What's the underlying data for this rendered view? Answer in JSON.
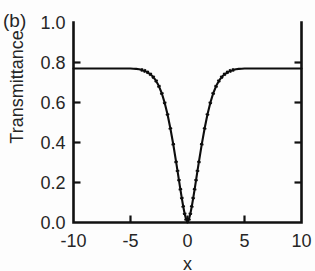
{
  "figure": {
    "panel_label": "(b)",
    "background_color": "#fdfdfd",
    "line_color": "#0d0d0d",
    "axis_color": "#111111"
  },
  "chart_data": {
    "type": "line",
    "title": "",
    "panel": "(b)",
    "xlabel": "x",
    "ylabel": "Transmittance",
    "xlim": [
      -10,
      10
    ],
    "ylim": [
      0.0,
      1.0
    ],
    "xticks": [
      -10,
      -5,
      0,
      5,
      10
    ],
    "xtick_labels": [
      "-10",
      "-5",
      "0",
      "5",
      "10"
    ],
    "yticks": [
      0.0,
      0.2,
      0.4,
      0.6,
      0.8,
      1.0
    ],
    "ytick_labels": [
      "0.0",
      "0.2",
      "0.4",
      "0.6",
      "0.8",
      "1.0"
    ],
    "grid": false,
    "legend": null,
    "tick_direction": "in",
    "spines": [
      "left",
      "bottom",
      "right"
    ],
    "baseline_transmittance": 0.77,
    "dip_center": 0,
    "dip_minimum": 0.0,
    "markers": "small dots along curve",
    "series": [
      {
        "name": "Transmittance",
        "x": [
          -10,
          -9.5,
          -9,
          -8.5,
          -8,
          -7.5,
          -7,
          -6.5,
          -6,
          -5.5,
          -5,
          -4.75,
          -4.5,
          -4.25,
          -4,
          -3.75,
          -3.5,
          -3.25,
          -3,
          -2.75,
          -2.5,
          -2.25,
          -2,
          -1.75,
          -1.5,
          -1.25,
          -1,
          -0.875,
          -0.75,
          -0.625,
          -0.5,
          -0.375,
          -0.25,
          -0.125,
          0,
          0.125,
          0.25,
          0.375,
          0.5,
          0.625,
          0.75,
          0.875,
          1,
          1.25,
          1.5,
          1.75,
          2,
          2.25,
          2.5,
          2.75,
          3,
          3.25,
          3.5,
          3.75,
          4,
          4.25,
          4.5,
          4.75,
          5,
          5.5,
          6,
          6.5,
          7,
          7.5,
          8,
          8.5,
          9,
          9.5,
          10
        ],
        "y": [
          0.77,
          0.77,
          0.77,
          0.77,
          0.77,
          0.77,
          0.77,
          0.77,
          0.77,
          0.77,
          0.77,
          0.769,
          0.768,
          0.766,
          0.763,
          0.758,
          0.751,
          0.741,
          0.727,
          0.708,
          0.681,
          0.645,
          0.598,
          0.54,
          0.47,
          0.391,
          0.303,
          0.258,
          0.212,
          0.166,
          0.122,
          0.08,
          0.044,
          0.016,
          0.0,
          0.016,
          0.044,
          0.08,
          0.122,
          0.166,
          0.212,
          0.258,
          0.303,
          0.391,
          0.47,
          0.54,
          0.598,
          0.645,
          0.681,
          0.708,
          0.727,
          0.741,
          0.751,
          0.758,
          0.763,
          0.766,
          0.768,
          0.769,
          0.77,
          0.77,
          0.77,
          0.77,
          0.77,
          0.77,
          0.77,
          0.77,
          0.77,
          0.77,
          0.77
        ]
      }
    ]
  }
}
